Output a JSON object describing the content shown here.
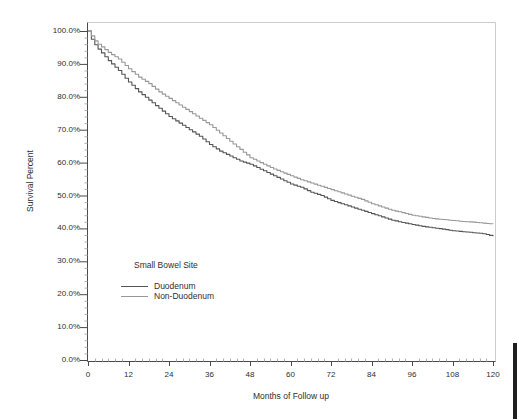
{
  "chart_data": {
    "type": "line",
    "subtype": "kaplan-meier-survival-step",
    "title": "",
    "xlabel": "Months of Follow up",
    "ylabel": "Survival Percent",
    "legend_title": "Small Bowel Site",
    "legend_position": "inside-lower-left",
    "grid": false,
    "xlim": [
      0,
      120
    ],
    "ylim": [
      0,
      100
    ],
    "x_ticks_major": [
      0,
      12,
      24,
      36,
      48,
      60,
      72,
      84,
      96,
      108,
      120
    ],
    "x_tick_labels": [
      "0",
      "12",
      "24",
      "36",
      "48",
      "60",
      "72",
      "84",
      "96",
      "108",
      "120"
    ],
    "y_ticks_major": [
      100,
      90,
      80,
      70,
      60,
      50,
      40,
      30,
      20,
      10,
      0
    ],
    "y_tick_labels": [
      "100.0%",
      "90.0%",
      "80.0%",
      "70.0%",
      "60.0%",
      "50.0%",
      "40.0%",
      "30.0%",
      "20.0%",
      "10.0%",
      "0.0%"
    ],
    "x": [
      0,
      1,
      2,
      3,
      6,
      9,
      12,
      15,
      18,
      21,
      24,
      27,
      30,
      33,
      36,
      39,
      42,
      45,
      48,
      51,
      54,
      57,
      60,
      63,
      66,
      69,
      72,
      75,
      78,
      81,
      84,
      87,
      90,
      93,
      96,
      99,
      102,
      105,
      108,
      111,
      114,
      117,
      120
    ],
    "series": [
      {
        "name": "Duodenum",
        "color": "#545454",
        "values": [
          100,
          97.5,
          95.8,
          94.5,
          91,
          88,
          84.5,
          81.5,
          79,
          76.5,
          74,
          72,
          70,
          68,
          65.5,
          63.5,
          62,
          60.5,
          59.5,
          58,
          56.5,
          55,
          53.5,
          52.5,
          51,
          50,
          48.5,
          47.5,
          46.5,
          45.5,
          44.5,
          43.5,
          42.5,
          41.8,
          41.2,
          40.6,
          40.2,
          39.8,
          39.3,
          39,
          38.7,
          38.4,
          37.6
        ]
      },
      {
        "name": "Non-Duodenum",
        "color": "#989898",
        "values": [
          100,
          98.5,
          97,
          96,
          93.5,
          91.5,
          88.5,
          86,
          84,
          81.5,
          79.5,
          77.5,
          75.5,
          73.5,
          71.5,
          69,
          66.5,
          64,
          61.5,
          60,
          58.5,
          57.2,
          56,
          54.8,
          53.8,
          52.8,
          51.8,
          50.8,
          49.8,
          48.8,
          47.5,
          46.5,
          45.5,
          44.8,
          44,
          43.5,
          43,
          42.7,
          42.4,
          42.1,
          41.9,
          41.6,
          41.3
        ]
      }
    ]
  },
  "colors": {
    "background": "#ffffff",
    "axis_line": "#4a4a4a",
    "box_border_light": "#cccccc",
    "major_tick": "#4a4a4a",
    "minor_tick": "#b0b0b0",
    "text": "#2e2e2e",
    "duodenum_curve": "#545454",
    "non_duodenum_curve": "#989898",
    "edge_artifact": "#1f1f1f"
  }
}
